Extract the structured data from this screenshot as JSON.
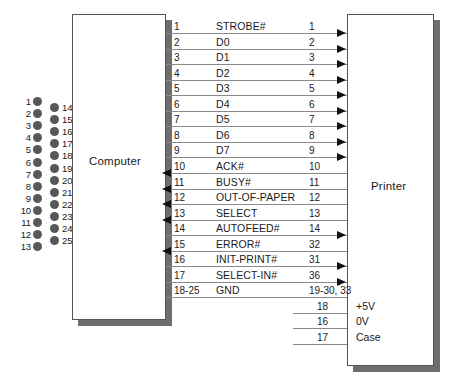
{
  "diagram": {
    "computer_label": "Computer",
    "printer_label": "Printer"
  },
  "connector": {
    "name": "db25-connector",
    "left_pins": [
      "1",
      "2",
      "3",
      "4",
      "5",
      "6",
      "7",
      "8",
      "9",
      "10",
      "11",
      "12",
      "13"
    ],
    "right_pins": [
      "14",
      "15",
      "16",
      "17",
      "18",
      "19",
      "20",
      "21",
      "22",
      "23",
      "24",
      "25"
    ]
  },
  "signals": [
    {
      "computer_pin": "1",
      "name": "STROBE#",
      "printer_pin": "1",
      "direction": "to-printer"
    },
    {
      "computer_pin": "2",
      "name": "D0",
      "printer_pin": "2",
      "direction": "to-printer"
    },
    {
      "computer_pin": "3",
      "name": "D1",
      "printer_pin": "3",
      "direction": "to-printer"
    },
    {
      "computer_pin": "4",
      "name": "D2",
      "printer_pin": "4",
      "direction": "to-printer"
    },
    {
      "computer_pin": "5",
      "name": "D3",
      "printer_pin": "5",
      "direction": "to-printer"
    },
    {
      "computer_pin": "6",
      "name": "D4",
      "printer_pin": "6",
      "direction": "to-printer"
    },
    {
      "computer_pin": "7",
      "name": "D5",
      "printer_pin": "7",
      "direction": "to-printer"
    },
    {
      "computer_pin": "8",
      "name": "D6",
      "printer_pin": "8",
      "direction": "to-printer"
    },
    {
      "computer_pin": "9",
      "name": "D7",
      "printer_pin": "9",
      "direction": "to-printer"
    },
    {
      "computer_pin": "10",
      "name": "ACK#",
      "printer_pin": "10",
      "direction": "to-computer"
    },
    {
      "computer_pin": "11",
      "name": "BUSY#",
      "printer_pin": "11",
      "direction": "to-computer"
    },
    {
      "computer_pin": "12",
      "name": "OUT-OF-PAPER",
      "printer_pin": "12",
      "direction": "to-computer"
    },
    {
      "computer_pin": "13",
      "name": "SELECT",
      "printer_pin": "13",
      "direction": "to-computer"
    },
    {
      "computer_pin": "14",
      "name": "AUTOFEED#",
      "printer_pin": "14",
      "direction": "to-printer"
    },
    {
      "computer_pin": "15",
      "name": "ERROR#",
      "printer_pin": "32",
      "direction": "to-computer"
    },
    {
      "computer_pin": "16",
      "name": "INIT-PRINT#",
      "printer_pin": "31",
      "direction": "to-printer"
    },
    {
      "computer_pin": "17",
      "name": "SELECT-IN#",
      "printer_pin": "36",
      "direction": "to-printer"
    },
    {
      "computer_pin": "18-25",
      "name": "GND",
      "printer_pin": "19-30, 33",
      "direction": "none"
    }
  ],
  "printer_only": [
    {
      "pin": "18",
      "label": "+5V"
    },
    {
      "pin": "16",
      "label": "0V"
    },
    {
      "pin": "17",
      "label": "Case"
    }
  ]
}
